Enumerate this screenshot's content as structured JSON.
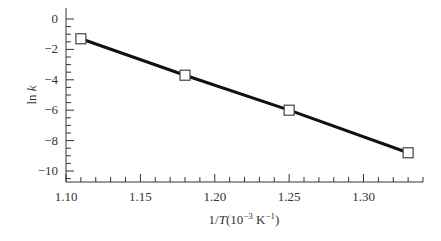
{
  "chart_data": {
    "type": "line",
    "title": "",
    "xlabel": "1/T(10⁻³ K⁻¹)",
    "ylabel": "ln k",
    "x": [
      1.11,
      1.18,
      1.25,
      1.33
    ],
    "series": [
      {
        "name": "ln k",
        "values": [
          -1.3,
          -3.7,
          -6.0,
          -8.8
        ]
      }
    ],
    "xlim": [
      1.1,
      1.34
    ],
    "ylim": [
      -10.7,
      0.5
    ],
    "xticks": [
      "1.10",
      "1.15",
      "1.20",
      "1.25",
      "1.30"
    ],
    "yticks": [
      "0",
      "−2",
      "−4",
      "−6",
      "−8",
      "−10"
    ],
    "grid": false,
    "marker": "open-square"
  }
}
